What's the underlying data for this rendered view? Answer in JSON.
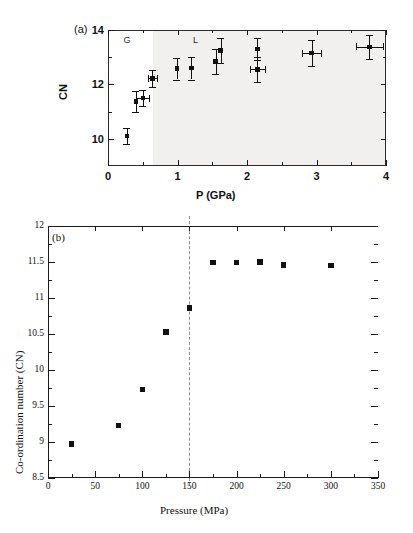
{
  "figure": {
    "background": "#ffffff",
    "marker_color": "#111111",
    "axis_color": "#1a1a1a",
    "shade_color": "#f2f0ee",
    "dashed_color": "#8c8c8c"
  },
  "chart_data": [
    {
      "type": "scatter",
      "panel_tag": "(a)",
      "title": "",
      "xlabel": "P (GPa)",
      "ylabel": "CN",
      "xlim": [
        0,
        4
      ],
      "ylim": [
        9,
        14
      ],
      "xticks": [
        0,
        1,
        2,
        3,
        4
      ],
      "xticklabels": [
        "0",
        "1",
        "2",
        "3",
        "4"
      ],
      "yticks": [
        10,
        12,
        14
      ],
      "yticklabels": [
        "10",
        "12",
        "14"
      ],
      "grid": false,
      "legend": "none",
      "annotations": [
        {
          "text": "G",
          "x": 0.28,
          "y": 13.6
        },
        {
          "text": "L",
          "x": 1.28,
          "y": 13.6
        }
      ],
      "shaded_region": {
        "x_start": 0.65,
        "x_end": 4.0,
        "label": "liquid-region-shading"
      },
      "points": [
        {
          "x": 0.27,
          "y": 10.1,
          "yerr": 0.3,
          "xerr": 0.0
        },
        {
          "x": 0.4,
          "y": 11.38,
          "yerr": 0.38,
          "xerr": 0.0
        },
        {
          "x": 0.5,
          "y": 11.5,
          "yerr": 0.3,
          "xerr": 0.09
        },
        {
          "x": 0.64,
          "y": 12.22,
          "yerr": 0.3,
          "xerr": 0.07
        },
        {
          "x": 0.99,
          "y": 12.58,
          "yerr": 0.4,
          "xerr": 0.0
        },
        {
          "x": 1.2,
          "y": 12.6,
          "yerr": 0.42,
          "xerr": 0.0
        },
        {
          "x": 1.55,
          "y": 12.85,
          "yerr": 0.45,
          "xerr": 0.0
        },
        {
          "x": 1.62,
          "y": 13.25,
          "yerr": 0.45,
          "xerr": 0.0
        },
        {
          "x": 2.15,
          "y": 13.3,
          "yerr": 0.42,
          "xerr": 0.0
        },
        {
          "x": 2.15,
          "y": 12.55,
          "yerr": 0.45,
          "xerr": 0.11
        },
        {
          "x": 2.93,
          "y": 13.15,
          "yerr": 0.48,
          "xerr": 0.14
        },
        {
          "x": 3.76,
          "y": 13.38,
          "yerr": 0.45,
          "xerr": 0.19
        }
      ]
    },
    {
      "type": "scatter",
      "panel_tag": "(b)",
      "title": "",
      "xlabel": "Pressure (MPa)",
      "ylabel": "Co-ordination number (CN)",
      "xlim": [
        0,
        350
      ],
      "ylim": [
        8.5,
        12
      ],
      "xticks": [
        0,
        50,
        100,
        150,
        200,
        250,
        300,
        350
      ],
      "xticklabels": [
        "0",
        "50",
        "100",
        "150",
        "200",
        "250",
        "300",
        "350"
      ],
      "yticks": [
        8.5,
        9,
        9.5,
        10,
        10.5,
        11,
        11.5,
        12
      ],
      "yticklabels": [
        "8.5",
        "9",
        "9.5",
        "10",
        "10.5",
        "11",
        "11.5",
        "12"
      ],
      "grid": false,
      "legend": "none",
      "vline": {
        "x": 150,
        "style": "dashed",
        "color": "#8c8c8c"
      },
      "x": [
        25,
        75,
        100,
        125,
        150,
        175,
        200,
        225,
        250,
        300
      ],
      "y": [
        8.97,
        9.23,
        9.73,
        10.53,
        10.86,
        11.49,
        11.49,
        11.5,
        11.46,
        11.45
      ]
    }
  ]
}
